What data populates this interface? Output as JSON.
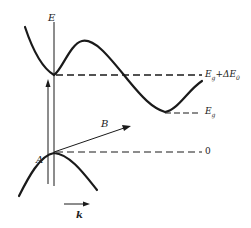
{
  "diagram": {
    "type": "band-structure-energy-diagram",
    "axis": {
      "vertical_label": "E",
      "horizontal_label": "k"
    },
    "levels": [
      {
        "name": "upper-valley-level",
        "label": "E_g+ΔE_0",
        "label_main": "E",
        "label_sub": "g",
        "label_rest": "+ΔE",
        "label_sub2": "0"
      },
      {
        "name": "indirect-gap-level",
        "label": "E_g",
        "label_main": "E",
        "label_sub": "g"
      },
      {
        "name": "valence-top-level",
        "label": "0"
      }
    ],
    "transitions": [
      {
        "name": "A",
        "label": "A",
        "kind": "direct (vertical)"
      },
      {
        "name": "B",
        "label": "B",
        "kind": "indirect (oblique)"
      }
    ],
    "curves": [
      {
        "name": "conduction-band",
        "description": "valley at k=0, hump, lower valley at large k"
      },
      {
        "name": "valence-band",
        "description": "maximum at k=0"
      }
    ],
    "colors": {
      "ink": "#1a1a1a",
      "background": "#ffffff"
    }
  }
}
